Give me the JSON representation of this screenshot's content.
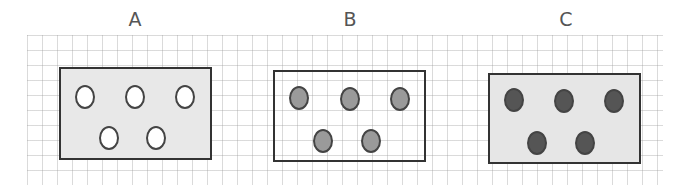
{
  "panels": [
    {
      "label": "A",
      "label_x": 135,
      "box": {
        "x": 59,
        "y": 67,
        "w": 153,
        "h": 93,
        "fill": "#e8e8e8"
      },
      "dot_fill": "#ffffff",
      "dots": [
        [
          24,
          28
        ],
        [
          74,
          28
        ],
        [
          124,
          28
        ],
        [
          48,
          69
        ],
        [
          95,
          69
        ]
      ]
    },
    {
      "label": "B",
      "label_x": 350,
      "box": {
        "x": 273,
        "y": 70,
        "w": 153,
        "h": 92,
        "fill": "transparent"
      },
      "dot_fill": "#9a9a9a",
      "dots": [
        [
          24,
          26
        ],
        [
          75,
          27
        ],
        [
          125,
          27
        ],
        [
          48,
          69
        ],
        [
          96,
          69
        ]
      ]
    },
    {
      "label": "C",
      "label_x": 566,
      "box": {
        "x": 488,
        "y": 73,
        "w": 153,
        "h": 91,
        "fill": "#e6e6e6"
      },
      "dot_fill": "#555555",
      "dots": [
        [
          24,
          25
        ],
        [
          74,
          26
        ],
        [
          124,
          26
        ],
        [
          47,
          68
        ],
        [
          95,
          68
        ]
      ]
    }
  ]
}
